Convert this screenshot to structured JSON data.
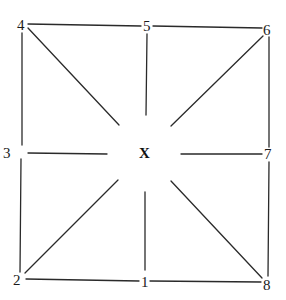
{
  "diagram": {
    "center_label": "X",
    "nodes": [
      {
        "id": "1",
        "label": "1",
        "position": "bottom-middle"
      },
      {
        "id": "2",
        "label": "2",
        "position": "bottom-left"
      },
      {
        "id": "3",
        "label": "3",
        "position": "middle-left"
      },
      {
        "id": "4",
        "label": "4",
        "position": "top-left"
      },
      {
        "id": "5",
        "label": "5",
        "position": "top-middle"
      },
      {
        "id": "6",
        "label": "6",
        "position": "top-right"
      },
      {
        "id": "7",
        "label": "7",
        "position": "middle-right"
      },
      {
        "id": "8",
        "label": "8",
        "position": "bottom-right"
      }
    ],
    "perimeter_edges": [
      [
        "4",
        "5"
      ],
      [
        "5",
        "6"
      ],
      [
        "6",
        "7"
      ],
      [
        "7",
        "8"
      ],
      [
        "8",
        "1"
      ],
      [
        "1",
        "2"
      ],
      [
        "2",
        "3"
      ],
      [
        "3",
        "4"
      ]
    ],
    "spokes_toward_center": [
      "1",
      "2",
      "3",
      "4",
      "5",
      "6",
      "7",
      "8"
    ]
  }
}
